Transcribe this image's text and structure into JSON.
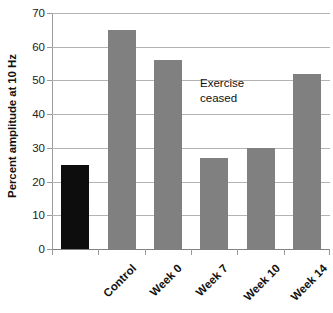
{
  "chart_data": {
    "type": "bar",
    "title": "",
    "xlabel": "",
    "ylabel": "Percent amplitude at 10 Hz",
    "categories": [
      "Control",
      "Week 0",
      "Week 7",
      "Week 10",
      "Week 14",
      "Week 17"
    ],
    "values": [
      25,
      65,
      56,
      27,
      30,
      52
    ],
    "bar_colors": [
      "#0d0d0d",
      "#808080",
      "#808080",
      "#808080",
      "#808080",
      "#808080"
    ],
    "ylim": [
      0,
      70
    ],
    "ytick_labels": [
      "0",
      "10",
      "20",
      "30",
      "40",
      "50",
      "60",
      "70"
    ],
    "ytick_values": [
      0,
      10,
      20,
      30,
      40,
      50,
      60,
      70
    ],
    "grid": "horizontal",
    "legend": "none",
    "annotations": [
      {
        "text_line1": "Exercise",
        "text_line2": "ceased",
        "x_category": "Week 14",
        "y_value": 45
      }
    ]
  },
  "colors": {
    "background": "#ffffff",
    "gridline": "#b3b3b3",
    "axis": "#9a9a9a",
    "text": "#111111",
    "bar_gray": "#808080",
    "bar_black": "#0d0d0d"
  }
}
